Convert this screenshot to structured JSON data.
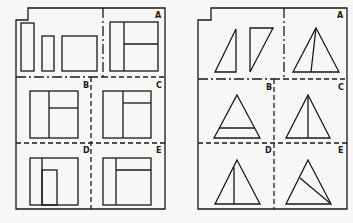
{
  "figure": {
    "ink_color": "#1a1a1a",
    "background_color": "#f7f7f5",
    "panels": [
      {
        "id": "rectangles",
        "labels": [
          "A",
          "B",
          "C",
          "D",
          "E"
        ],
        "options": [
          {
            "label": "A",
            "description": "square divided by a vertical line, right part split horizontally"
          },
          {
            "label": "B",
            "description": "square divided by a vertical line, right part split horizontally lower"
          },
          {
            "label": "C",
            "description": "square divided by a vertical line, right part split horizontally near top"
          },
          {
            "label": "D",
            "description": "square with vertical strip and inner tall rectangle"
          },
          {
            "label": "E",
            "description": "square with vertical line and horizontal line near top on right part"
          }
        ],
        "pieces": [
          "tall narrow rectangle",
          "short narrow rectangle",
          "square-ish rectangle"
        ]
      },
      {
        "id": "triangles",
        "labels": [
          "A",
          "B",
          "C",
          "D",
          "E"
        ],
        "options": [
          {
            "label": "A",
            "description": "triangle split by line from apex to base left of center"
          },
          {
            "label": "B",
            "description": "triangle with horizontal line near base"
          },
          {
            "label": "C",
            "description": "triangle split by vertical line from apex"
          },
          {
            "label": "D",
            "description": "triangle with vertical line not reaching apex"
          },
          {
            "label": "E",
            "description": "triangle with diagonal line from left side to right base corner"
          }
        ],
        "pieces": [
          "right triangle pointing up",
          "right triangle pointing down"
        ]
      }
    ]
  }
}
